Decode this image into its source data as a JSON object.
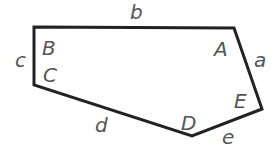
{
  "diagram": {
    "type": "pentagon",
    "stroke_color": "#222222",
    "label_color": "#555555",
    "vertices": [
      {
        "id": "TL",
        "x": 34,
        "y": 27
      },
      {
        "id": "TR",
        "x": 234,
        "y": 28
      },
      {
        "id": "R",
        "x": 262,
        "y": 109
      },
      {
        "id": "BOT",
        "x": 192,
        "y": 136
      },
      {
        "id": "BL",
        "x": 34,
        "y": 85
      }
    ],
    "angle_labels": {
      "A": "A",
      "B": "B",
      "C": "C",
      "D": "D",
      "E": "E"
    },
    "side_labels": {
      "a": "a",
      "b": "b",
      "c": "c",
      "d": "d",
      "e": "e"
    }
  }
}
